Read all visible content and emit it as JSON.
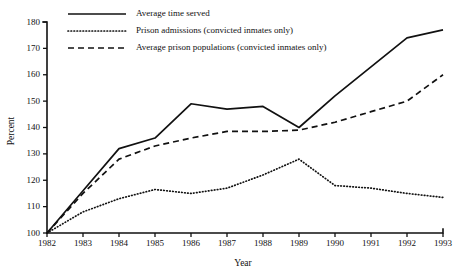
{
  "chart_data": {
    "type": "line",
    "title": "",
    "xlabel": "Year",
    "ylabel": "Percent",
    "x": [
      1982,
      1983,
      1984,
      1985,
      1986,
      1987,
      1988,
      1989,
      1990,
      1991,
      1992,
      1993
    ],
    "xtick_labels": [
      "1982",
      "1983",
      "1984",
      "1985",
      "1986",
      "1987",
      "1988",
      "1989",
      "1990",
      "1991",
      "1992",
      "1993"
    ],
    "ytick_labels": [
      "100",
      "110",
      "120",
      "130",
      "140",
      "150",
      "160",
      "170",
      "180"
    ],
    "yticks": [
      100,
      110,
      120,
      130,
      140,
      150,
      160,
      170,
      180
    ],
    "ylim": [
      100,
      180
    ],
    "xlim": [
      1982,
      1993
    ],
    "grid": false,
    "legend_position": "top-left",
    "series": [
      {
        "name": "Average time served",
        "style": "solid",
        "color": "#111111",
        "values": [
          100,
          116,
          132,
          136,
          149,
          147,
          148,
          140,
          152,
          163,
          174,
          177
        ]
      },
      {
        "name": "Prison admissions (convicted inmates only)",
        "style": "dotted",
        "color": "#111111",
        "values": [
          100,
          108,
          113,
          116.5,
          115,
          117,
          122,
          128,
          118,
          117,
          115,
          113.5
        ]
      },
      {
        "name": "Average prison populations (convicted inmates only)",
        "style": "dashed",
        "color": "#111111",
        "values": [
          100,
          115,
          128,
          133,
          136,
          138.5,
          138.5,
          139,
          142,
          146,
          150,
          160
        ]
      }
    ]
  },
  "legend": {
    "items": [
      {
        "label": "Average time served",
        "style": "solid"
      },
      {
        "label": "Prison admissions (convicted inmates only)",
        "style": "dotted"
      },
      {
        "label": "Average prison populations (convicted inmates only)",
        "style": "dashed"
      }
    ]
  },
  "axes": {
    "y_title": "Percent",
    "x_title": "Year"
  }
}
